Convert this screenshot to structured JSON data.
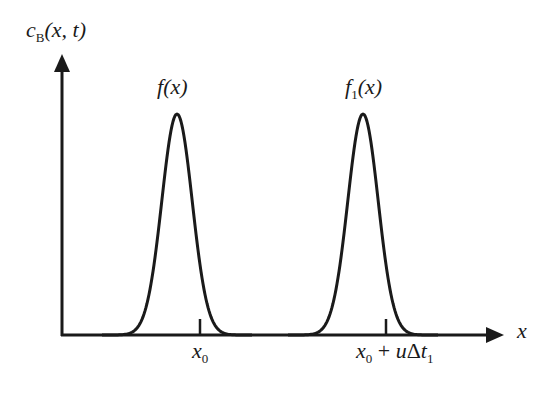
{
  "diagram": {
    "type": "line",
    "y_axis": {
      "label_symbol": "c",
      "label_subscript": "B",
      "label_args": "(x, t)"
    },
    "x_axis": {
      "label": "x"
    },
    "curves": [
      {
        "name_base": "f",
        "name_subscript": "",
        "name_args": "(x)",
        "peak_label": "f(x)"
      },
      {
        "name_base": "f",
        "name_subscript": "1",
        "name_args": "(x)",
        "peak_label": "f1(x)"
      }
    ],
    "ticks": [
      {
        "label_var": "x",
        "label_sub": "0",
        "label_rest": "",
        "label_rest_var": "",
        "label_rest_sub": ""
      },
      {
        "label_var": "x",
        "label_sub": "0",
        "label_rest": " + ",
        "label_rest_var": "u",
        "label_delta": "Δ",
        "label_rest_var2": "t",
        "label_rest_sub": "1"
      }
    ],
    "colors": {
      "stroke": "#1a1a1a",
      "background": "#ffffff"
    }
  },
  "chart_data": {
    "type": "line",
    "title": "",
    "xlabel": "x",
    "ylabel": "c_B(x, t)",
    "series": [
      {
        "name": "f(x)",
        "shape": "gaussian",
        "center_px": 177,
        "amplitude_rel": 1.0
      },
      {
        "name": "f1(x)",
        "shape": "gaussian",
        "center_px": 363,
        "amplitude_rel": 1.0
      }
    ],
    "x_ticks": [
      "x0",
      "x0 + uΔt1"
    ],
    "grid": false,
    "legend": "none"
  }
}
